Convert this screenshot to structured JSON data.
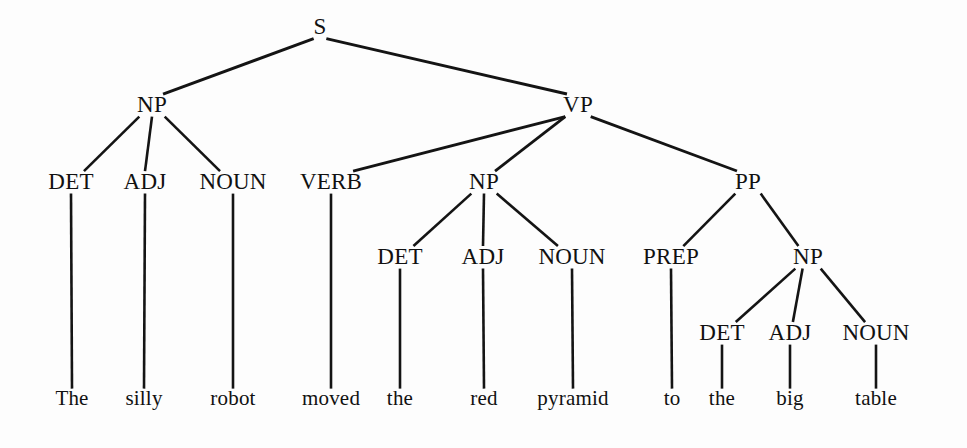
{
  "figure": {
    "kind": "constituency-parse-tree",
    "sentence": "The silly robot moved the red pyramid to the big table",
    "background_color": "#fdfdfd",
    "ink_color": "#141414",
    "width": 967,
    "height": 448
  },
  "nodes": [
    {
      "id": "S",
      "label": "S",
      "x": 320,
      "y": 34,
      "kind": "nonterminal"
    },
    {
      "id": "NP1",
      "label": "NP",
      "x": 152,
      "y": 112,
      "kind": "nonterminal"
    },
    {
      "id": "VP",
      "label": "VP",
      "x": 578,
      "y": 112,
      "kind": "nonterminal"
    },
    {
      "id": "DET1",
      "label": "DET",
      "x": 71,
      "y": 189,
      "kind": "preterminal"
    },
    {
      "id": "ADJ1",
      "label": "ADJ",
      "x": 145,
      "y": 189,
      "kind": "preterminal"
    },
    {
      "id": "NOUN1",
      "label": "NOUN",
      "x": 233,
      "y": 189,
      "kind": "preterminal"
    },
    {
      "id": "VERB",
      "label": "VERB",
      "x": 331,
      "y": 189,
      "kind": "preterminal"
    },
    {
      "id": "NP2",
      "label": "NP",
      "x": 484,
      "y": 189,
      "kind": "nonterminal"
    },
    {
      "id": "PP",
      "label": "PP",
      "x": 748,
      "y": 189,
      "kind": "nonterminal"
    },
    {
      "id": "DET2",
      "label": "DET",
      "x": 400,
      "y": 264,
      "kind": "preterminal"
    },
    {
      "id": "ADJ2",
      "label": "ADJ",
      "x": 483,
      "y": 264,
      "kind": "preterminal"
    },
    {
      "id": "NOUN2",
      "label": "NOUN",
      "x": 572,
      "y": 264,
      "kind": "preterminal"
    },
    {
      "id": "PREP",
      "label": "PREP",
      "x": 671,
      "y": 264,
      "kind": "preterminal"
    },
    {
      "id": "NP3",
      "label": "NP",
      "x": 808,
      "y": 264,
      "kind": "nonterminal"
    },
    {
      "id": "DET3",
      "label": "DET",
      "x": 722,
      "y": 340,
      "kind": "preterminal"
    },
    {
      "id": "ADJ3",
      "label": "ADJ",
      "x": 790,
      "y": 340,
      "kind": "preterminal"
    },
    {
      "id": "NOUN3",
      "label": "NOUN",
      "x": 876,
      "y": 340,
      "kind": "preterminal"
    },
    {
      "id": "W_THE1",
      "label": "The",
      "x": 72,
      "y": 405,
      "kind": "terminal"
    },
    {
      "id": "W_SILLY",
      "label": "silly",
      "x": 144,
      "y": 405,
      "kind": "terminal"
    },
    {
      "id": "W_ROBOT",
      "label": "robot",
      "x": 233,
      "y": 405,
      "kind": "terminal"
    },
    {
      "id": "W_MOVED",
      "label": "moved",
      "x": 331,
      "y": 405,
      "kind": "terminal"
    },
    {
      "id": "W_THE2",
      "label": "the",
      "x": 400,
      "y": 405,
      "kind": "terminal"
    },
    {
      "id": "W_RED",
      "label": "red",
      "x": 484,
      "y": 405,
      "kind": "terminal"
    },
    {
      "id": "W_PYRAMID",
      "label": "pyramid",
      "x": 573,
      "y": 405,
      "kind": "terminal"
    },
    {
      "id": "W_TO",
      "label": "to",
      "x": 672,
      "y": 405,
      "kind": "terminal"
    },
    {
      "id": "W_THE3",
      "label": "the",
      "x": 722,
      "y": 405,
      "kind": "terminal"
    },
    {
      "id": "W_BIG",
      "label": "big",
      "x": 790,
      "y": 405,
      "kind": "terminal"
    },
    {
      "id": "W_TABLE",
      "label": "table",
      "x": 876,
      "y": 405,
      "kind": "terminal"
    }
  ],
  "edges": [
    {
      "from": "S",
      "to": "NP1",
      "width": 3.0
    },
    {
      "from": "S",
      "to": "VP",
      "width": 3.0
    },
    {
      "from": "NP1",
      "to": "DET1",
      "width": 2.6
    },
    {
      "from": "NP1",
      "to": "ADJ1",
      "width": 2.6
    },
    {
      "from": "NP1",
      "to": "NOUN1",
      "width": 2.6
    },
    {
      "from": "VP",
      "to": "VERB",
      "width": 2.8
    },
    {
      "from": "VP",
      "to": "NP2",
      "width": 2.8
    },
    {
      "from": "VP",
      "to": "PP",
      "width": 2.8
    },
    {
      "from": "NP2",
      "to": "DET2",
      "width": 2.6
    },
    {
      "from": "NP2",
      "to": "ADJ2",
      "width": 2.6
    },
    {
      "from": "NP2",
      "to": "NOUN2",
      "width": 2.6
    },
    {
      "from": "PP",
      "to": "PREP",
      "width": 2.6
    },
    {
      "from": "PP",
      "to": "NP3",
      "width": 2.6
    },
    {
      "from": "NP3",
      "to": "DET3",
      "width": 2.6
    },
    {
      "from": "NP3",
      "to": "ADJ3",
      "width": 2.6
    },
    {
      "from": "NP3",
      "to": "NOUN3",
      "width": 2.6
    },
    {
      "from": "DET1",
      "to": "W_THE1",
      "width": 2.6
    },
    {
      "from": "ADJ1",
      "to": "W_SILLY",
      "width": 2.6
    },
    {
      "from": "NOUN1",
      "to": "W_ROBOT",
      "width": 2.6
    },
    {
      "from": "VERB",
      "to": "W_MOVED",
      "width": 2.6
    },
    {
      "from": "DET2",
      "to": "W_THE2",
      "width": 2.6
    },
    {
      "from": "ADJ2",
      "to": "W_RED",
      "width": 2.6
    },
    {
      "from": "NOUN2",
      "to": "W_PYRAMID",
      "width": 2.6
    },
    {
      "from": "PREP",
      "to": "W_TO",
      "width": 2.6
    },
    {
      "from": "DET3",
      "to": "W_THE3",
      "width": 2.6
    },
    {
      "from": "ADJ3",
      "to": "W_BIG",
      "width": 2.6
    },
    {
      "from": "NOUN3",
      "to": "W_TABLE",
      "width": 2.6
    }
  ]
}
